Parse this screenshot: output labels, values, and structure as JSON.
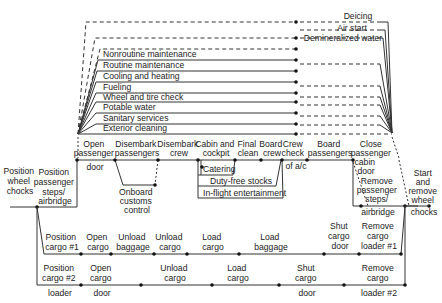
{
  "diagram": {
    "servicing": {
      "optional": [
        "Deicing",
        "Air start",
        "Demineralized water"
      ],
      "tasks": [
        "Nonroutine maintenance",
        "Routine maintenance",
        "Cooling and heating",
        "Fueling",
        "Wheel and tire check",
        "Potable water",
        "Sanitary services",
        "Exterior cleaning"
      ]
    },
    "passenger_path": {
      "start_left": [
        "Position",
        "wheel",
        "chocks"
      ],
      "position_steps": [
        "Position",
        "passenger",
        "steps/",
        "airbridge"
      ],
      "open_door": [
        "Open",
        "passenger",
        "door"
      ],
      "disembark_pax": [
        "Disembark",
        "passengers"
      ],
      "disembark_crew": [
        "Disembark",
        "crew"
      ],
      "onboard_customs": [
        "Onboard",
        "customs",
        "control"
      ],
      "cabin_cockpit": [
        "Cabin and",
        "cockpit"
      ],
      "final_clean": [
        "Final",
        "clean"
      ],
      "board_crew": [
        "Board",
        "crew"
      ],
      "crew_check": [
        "Crew",
        "check",
        "of a/c"
      ],
      "board_pax": [
        "Board",
        "passengers"
      ],
      "close_door": [
        "Close",
        "passenger",
        "cabin",
        "door"
      ],
      "remove_steps": [
        "Remove",
        "passenger",
        "steps/",
        "airbridge"
      ],
      "end_right": [
        "Start",
        "and",
        "remove",
        "wheel",
        "chocks"
      ],
      "cabin_services": [
        "Catering",
        "Duty-free stocks",
        "In-flight entertainment"
      ]
    },
    "cargo_1": {
      "steps": [
        [
          "Position",
          "cargo #1"
        ],
        [
          "Open",
          "cargo"
        ],
        [
          "Unload",
          "baggage"
        ],
        [
          "Unload",
          "cargo"
        ],
        [
          "Load",
          "cargo"
        ],
        [
          "Load",
          "baggage"
        ],
        [
          "Shut",
          "cargo",
          "door"
        ],
        [
          "Remove",
          "cargo",
          "loader #1"
        ]
      ]
    },
    "cargo_2": {
      "steps": [
        [
          "Position",
          "cargo #2",
          "loader"
        ],
        [
          "Open",
          "cargo",
          "door"
        ],
        [
          "Unload",
          "cargo"
        ],
        [
          "Load",
          "cargo"
        ],
        [
          "Shut",
          "cargo",
          "door"
        ],
        [
          "Remove",
          "cargo",
          "loader #2"
        ]
      ]
    }
  }
}
